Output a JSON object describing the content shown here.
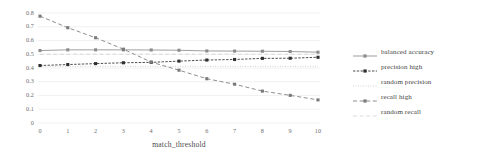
{
  "chart_data": {
    "type": "line",
    "title": "",
    "xlabel": "match_threshold",
    "ylabel": "",
    "x": [
      0,
      1,
      2,
      3,
      4,
      5,
      6,
      7,
      8,
      9,
      10
    ],
    "xlim": [
      0,
      10
    ],
    "ylim": [
      0,
      0.8
    ],
    "ytick_labels": [
      "0.8",
      "0.7",
      "0.6",
      "0.5",
      "0.4",
      "0.3",
      "0.2",
      "0.1",
      "0"
    ],
    "ytick_values": [
      0.8,
      0.7,
      0.6,
      0.5,
      0.4,
      0.3,
      0.2,
      0.1,
      0
    ],
    "xtick_labels": [
      "0",
      "1",
      "2",
      "3",
      "4",
      "5",
      "6",
      "7",
      "8",
      "9",
      "10"
    ],
    "grid": "horizontal",
    "legend_position": "right",
    "series": [
      {
        "name": "balanced accuracy",
        "values": [
          0.527,
          0.532,
          0.532,
          0.532,
          0.531,
          0.529,
          0.524,
          0.523,
          0.522,
          0.52,
          0.515
        ],
        "style": "solid",
        "marker": "square",
        "color": "#8c8c8c"
      },
      {
        "name": "precision high",
        "values": [
          0.418,
          0.425,
          0.432,
          0.438,
          0.441,
          0.45,
          0.458,
          0.462,
          0.47,
          0.471,
          0.478
        ],
        "style": "dense-dash",
        "marker": "square",
        "color": "#2e2e2e"
      },
      {
        "name": "random precision",
        "values": [
          0.412,
          0.412,
          0.412,
          0.412,
          0.412,
          0.412,
          0.412,
          0.412,
          0.412,
          0.412,
          0.412
        ],
        "style": "dotted",
        "marker": "none",
        "color": "#b5b5b5"
      },
      {
        "name": "recall high",
        "values": [
          0.777,
          0.693,
          0.62,
          0.537,
          0.443,
          0.384,
          0.322,
          0.282,
          0.232,
          0.201,
          0.168
        ],
        "style": "dashed",
        "marker": "square",
        "color": "#7a7a7a"
      },
      {
        "name": "random recall",
        "values": [
          0.5,
          0.5,
          0.5,
          0.5,
          0.5,
          0.5,
          0.5,
          0.5,
          0.5,
          0.5,
          0.5
        ],
        "style": "dashed",
        "marker": "none",
        "color": "#c4c4c4"
      }
    ]
  }
}
